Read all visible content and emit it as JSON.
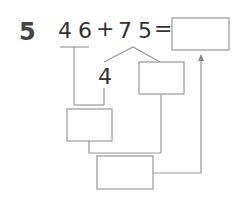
{
  "problem": {
    "number": "5",
    "expression": "46+75=",
    "parts": [
      "4",
      "6",
      "+",
      "7",
      "5",
      "="
    ],
    "split_digit": "4"
  },
  "boxes": [
    {
      "id": "answer",
      "value": ""
    },
    {
      "id": "split-remainder",
      "value": ""
    },
    {
      "id": "tens-sum",
      "value": ""
    },
    {
      "id": "final-sum",
      "value": ""
    }
  ]
}
